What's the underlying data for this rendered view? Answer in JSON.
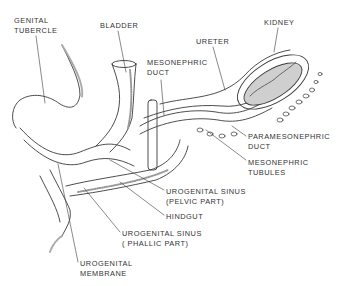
{
  "diagram": {
    "labels": [
      {
        "id": "genital-tubercle",
        "lines": [
          "GENITAL",
          "TUBERCLE"
        ],
        "x": 14,
        "y": 16
      },
      {
        "id": "bladder",
        "lines": [
          "BLADDER"
        ],
        "x": 100,
        "y": 21
      },
      {
        "id": "mesonephric-duct",
        "lines": [
          "MESONEPHRIC",
          "DUCT"
        ],
        "x": 147,
        "y": 58
      },
      {
        "id": "kidney",
        "lines": [
          "KIDNEY"
        ],
        "x": 264,
        "y": 18
      },
      {
        "id": "ureter",
        "lines": [
          "URETER"
        ],
        "x": 196,
        "y": 37
      },
      {
        "id": "paramesonephric-duct",
        "lines": [
          "PARAMESONEPHRIC",
          "DUCT"
        ],
        "x": 248,
        "y": 132
      },
      {
        "id": "mesonephric-tubules",
        "lines": [
          "MESONEPHRIC",
          "TUBULES"
        ],
        "x": 248,
        "y": 158
      },
      {
        "id": "urogenital-sinus-pelvic",
        "lines": [
          "UROGENITAL SINUS",
          "(PELVIC PART)"
        ],
        "x": 166,
        "y": 187
      },
      {
        "id": "hindgut",
        "lines": [
          "HINDGUT"
        ],
        "x": 166,
        "y": 212
      },
      {
        "id": "urogenital-sinus-phallic",
        "lines": [
          "UROGENITAL SINUS",
          "( PHALLIC PART)"
        ],
        "x": 122,
        "y": 229
      },
      {
        "id": "urogenital-membrane",
        "lines": [
          "UROGENITAL",
          "MEMBRANE"
        ],
        "x": 80,
        "y": 259
      }
    ],
    "colors": {
      "line": "#3a3a3a",
      "kidney_fill": "#cfcfcf",
      "stipple": "#9a9a9a"
    }
  }
}
